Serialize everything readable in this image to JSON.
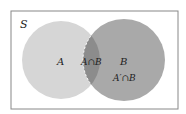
{
  "diagram": {
    "type": "venn",
    "universe_label": "S",
    "sets": [
      {
        "name": "A",
        "label": "A",
        "color": "#d6d6d6"
      },
      {
        "name": "B",
        "label": "B",
        "color": "#a9a9a9"
      }
    ],
    "regions": {
      "intersection": {
        "label": "A∩B",
        "color": "#8c8c8c"
      },
      "b_only": {
        "label": "A′∩B"
      }
    },
    "colors": {
      "background": "#ffffff",
      "border": "#888888",
      "intersection_outline": "#ffffff"
    }
  }
}
